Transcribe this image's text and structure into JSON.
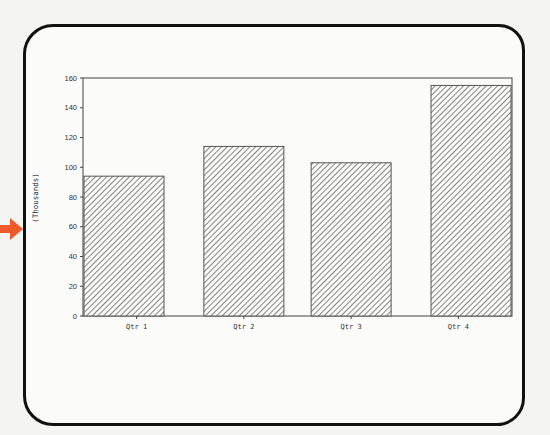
{
  "chart_data": {
    "type": "bar",
    "title": "",
    "xlabel": "",
    "ylabel": "(Thousands)",
    "categories": [
      "Qtr 1",
      "Qtr 2",
      "Qtr 3",
      "Qtr 4"
    ],
    "values": [
      94,
      114,
      103,
      155
    ],
    "ylim": [
      0,
      160
    ],
    "yticks": [
      0,
      20,
      40,
      60,
      80,
      100,
      120,
      140,
      160
    ],
    "grid": false,
    "legend": null,
    "bar_fill": "diagonal-hatch",
    "colors": {
      "bar_stroke": "#555555",
      "hatch": "#666666",
      "axis": "#444444",
      "frame": "#111111",
      "arrow": "#ee5a2a"
    }
  },
  "annotations": {
    "pointer_arrow": "orange-arrow-pointing-right"
  }
}
